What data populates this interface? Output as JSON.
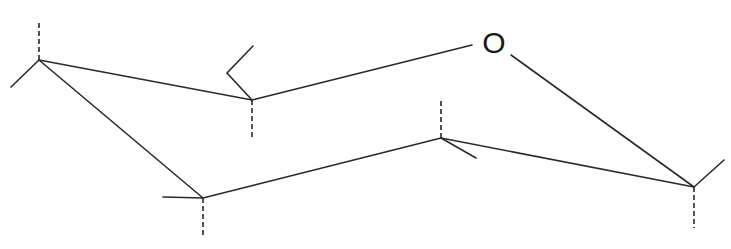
{
  "diagram": {
    "type": "chair-conformation-ring",
    "ring_atom_label": "O",
    "stroke_color": "#2a2a2a",
    "background": "#ffffff"
  }
}
